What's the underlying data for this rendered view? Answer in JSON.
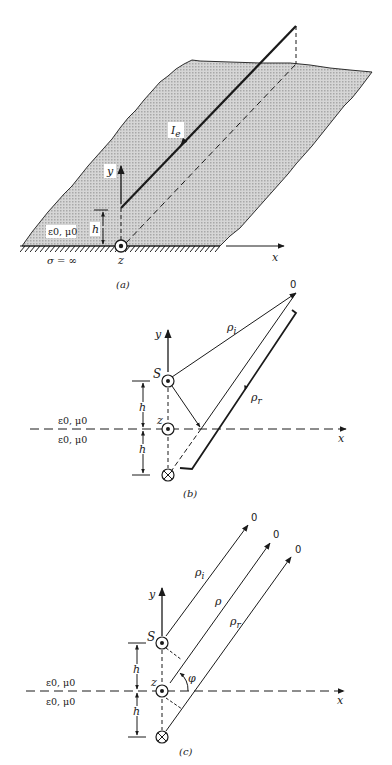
{
  "figure": {
    "panels": [
      {
        "id": "a",
        "caption": "(a)",
        "labels": {
          "current": "I",
          "current_sub": "e",
          "y_axis": "y",
          "x_axis": "x",
          "z_axis": "z",
          "height": "h",
          "medium": "ε0, μ0",
          "conductivity": "σ = ∞"
        }
      },
      {
        "id": "b",
        "caption": "(b)",
        "labels": {
          "observer": "0",
          "rho_incident": "ρi",
          "rho_reflected": "ρr",
          "source": "S",
          "y_axis": "y",
          "x_axis": "x",
          "z_axis": "z",
          "height_upper": "h",
          "height_lower": "h",
          "medium_upper": "ε0, μ0",
          "medium_lower": "ε0, μ0"
        }
      },
      {
        "id": "c",
        "caption": "(c)",
        "labels": {
          "observer_1": "0",
          "observer_2": "0",
          "observer_3": "0",
          "rho_incident": "ρi",
          "rho": "ρ",
          "rho_reflected": "ρr",
          "source": "S",
          "angle": "φ",
          "y_axis": "y",
          "x_axis": "x",
          "z_axis": "z",
          "height_upper": "h",
          "height_lower": "h",
          "medium_upper": "ε0, μ0",
          "medium_lower": "ε0, μ0"
        }
      }
    ],
    "colors": {
      "ink": "#1a1a1a",
      "plane_fill": "#c9c9c9"
    }
  }
}
